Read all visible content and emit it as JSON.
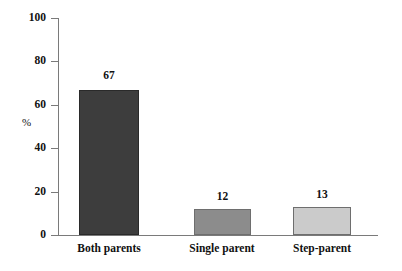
{
  "chart_data": {
    "type": "bar",
    "title": "",
    "xlabel": "",
    "ylabel": "%",
    "categories": [
      "Both parents",
      "Single parent",
      "Step-parent"
    ],
    "values": [
      67,
      12,
      13
    ],
    "value_labels": [
      "67",
      "12",
      "13"
    ],
    "ylim": [
      0,
      100
    ],
    "yticks": [
      0,
      20,
      40,
      60,
      80,
      100
    ],
    "ytick_labels": [
      "0",
      "20",
      "40",
      "60",
      "80",
      "100"
    ],
    "grid": false,
    "legend": null,
    "bar_colors": [
      "#3d3d3d",
      "#8c8c8c",
      "#cbcbcb"
    ],
    "axis_color": "#7a7a7a",
    "text_color": "#111111",
    "background": "#ffffff"
  },
  "axis": {
    "y_title": "%",
    "ticks": [
      {
        "label": "100",
        "value": 100
      },
      {
        "label": "80",
        "value": 80
      },
      {
        "label": "60",
        "value": 60
      },
      {
        "label": "40",
        "value": 40
      },
      {
        "label": "20",
        "value": 20
      },
      {
        "label": "0",
        "value": 0
      }
    ]
  },
  "bars": [
    {
      "category": "Both parents",
      "value_label": "67"
    },
    {
      "category": "Single parent",
      "value_label": "12"
    },
    {
      "category": "Step-parent",
      "value_label": "13"
    }
  ]
}
